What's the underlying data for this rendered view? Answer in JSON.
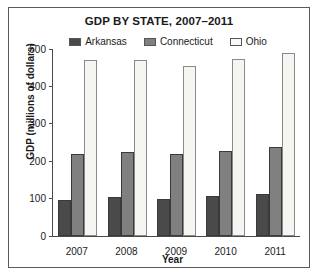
{
  "chart_data": {
    "type": "bar",
    "title": "GDP BY STATE, 2007–2011",
    "xlabel": "Year",
    "ylabel": "GDP (millions of dollars)",
    "categories": [
      "2007",
      "2008",
      "2009",
      "2010",
      "2011"
    ],
    "series": [
      {
        "name": "Arkansas",
        "color": "#4a4a4a",
        "values": [
          97,
          103,
          100,
          108,
          113
        ]
      },
      {
        "name": "Connecticut",
        "color": "#808080",
        "values": [
          220,
          224,
          219,
          227,
          238
        ]
      },
      {
        "name": "Ohio",
        "color": "#f5f5f2",
        "values": [
          470,
          470,
          455,
          472,
          490
        ]
      }
    ],
    "ylim": [
      0,
      500
    ],
    "yticks": [
      0,
      100,
      200,
      300,
      400,
      500
    ],
    "ytick_labels": [
      "0",
      "100",
      "200",
      "300",
      "400",
      "500"
    ],
    "grid": false,
    "legend_position": "top"
  }
}
